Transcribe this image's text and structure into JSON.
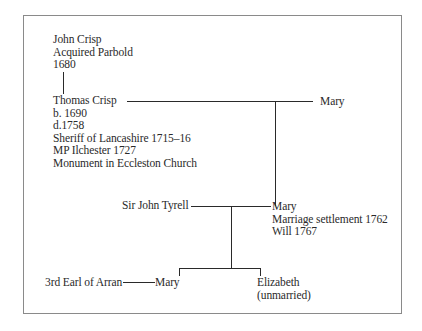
{
  "diagram": {
    "type": "family-tree",
    "people": {
      "john_crisp": {
        "name": "John Crisp",
        "details": [
          "Acquired Parbold",
          "1680"
        ]
      },
      "thomas_crisp": {
        "name": "Thomas Crisp",
        "details": [
          "b. 1690",
          "d.1758",
          "Sheriff of Lancashire 1715–16",
          "MP Ilchester 1727",
          "Monument in Eccleston Church"
        ]
      },
      "mary_spouse_thomas": {
        "name": "Mary"
      },
      "sir_john_tyrell": {
        "name": "Sir John Tyrell"
      },
      "mary_daughter": {
        "name": "Mary",
        "details": [
          "Marriage settlement 1762",
          "Will 1767"
        ]
      },
      "earl_of_arran": {
        "name": "3rd Earl of Arran"
      },
      "mary_granddaughter": {
        "name": "Mary"
      },
      "elizabeth": {
        "name": "Elizabeth",
        "details": [
          "(unmarried)"
        ]
      }
    },
    "relationships": [
      {
        "type": "parent-child",
        "parent": "John Crisp",
        "child": "Thomas Crisp"
      },
      {
        "type": "marriage",
        "a": "Thomas Crisp",
        "b": "Mary"
      },
      {
        "type": "parent-child",
        "parent": "Thomas Crisp & Mary",
        "child": "Mary"
      },
      {
        "type": "marriage",
        "a": "Sir John Tyrell",
        "b": "Mary"
      },
      {
        "type": "parent-child",
        "parent": "Sir John Tyrell & Mary",
        "child": "Mary"
      },
      {
        "type": "parent-child",
        "parent": "Sir John Tyrell & Mary",
        "child": "Elizabeth"
      },
      {
        "type": "marriage",
        "a": "3rd Earl of Arran",
        "b": "Mary"
      }
    ],
    "colors": {
      "text": "#2a2a2a",
      "lines": "#2a2a2a",
      "frame": "#8a8a8a",
      "background": "#ffffff"
    }
  }
}
